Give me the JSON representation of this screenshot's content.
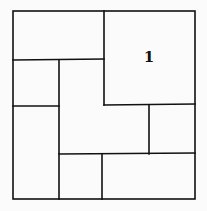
{
  "diagram": {
    "type": "rectangle-dissection",
    "stroke_color": "#111111",
    "background": "#fbfbfb",
    "outer": {
      "x1": 13,
      "y1": 11,
      "x2": 195,
      "y2": 199
    },
    "regions": [
      {
        "id": "top-left",
        "label": ""
      },
      {
        "id": "top-right",
        "label": "1"
      },
      {
        "id": "left-middle",
        "label": ""
      },
      {
        "id": "left-bottom",
        "label": ""
      },
      {
        "id": "center-l-shape",
        "label": ""
      },
      {
        "id": "right-middle",
        "label": ""
      },
      {
        "id": "bottom-middle",
        "label": ""
      },
      {
        "id": "bottom-right",
        "label": ""
      }
    ]
  }
}
